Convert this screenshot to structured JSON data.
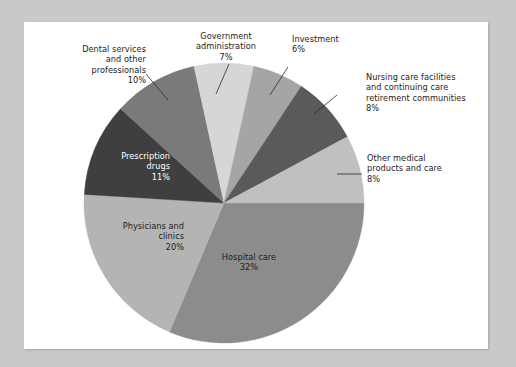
{
  "figure": {
    "background_color": "#c9c9c9",
    "card_color": "#ffffff"
  },
  "chart_data": {
    "type": "pie",
    "title": "",
    "subtitle": "",
    "xlabel": "",
    "ylabel": "",
    "legend_position": "none",
    "grid": false,
    "start_angle_deg": 0,
    "direction": "clockwise",
    "unit": "%",
    "categories": [
      "Hospital care",
      "Physicians and clinics",
      "Prescription drugs",
      "Dental services and other professionals",
      "Government administration",
      "Investment",
      "Nursing care facilities and continuing care retirement communities",
      "Other medical products and care"
    ],
    "values": [
      32,
      20,
      11,
      10,
      7,
      6,
      8,
      8
    ],
    "colors": [
      "#8c8c8c",
      "#b4b4b4",
      "#3f3f3f",
      "#7a7a7a",
      "#d6d6d6",
      "#a5a5a5",
      "#5a5a5a",
      "#c0c0c0"
    ],
    "slices": [
      {
        "label": "Hospital care",
        "value": 32,
        "value_text": "32%",
        "color": "#8c8c8c",
        "label_placement": "inside",
        "text_color": "#1c1c1c"
      },
      {
        "label": "Physicians and clinics",
        "value": 20,
        "value_text": "20%",
        "color": "#b4b4b4",
        "label_placement": "inside",
        "text_color": "#1c1c1c"
      },
      {
        "label": "Prescription drugs",
        "value": 11,
        "value_text": "11%",
        "color": "#3f3f3f",
        "label_placement": "inside",
        "text_color": "#ffffff"
      },
      {
        "label": "Dental services and other professionals",
        "value": 10,
        "value_text": "10%",
        "color": "#7a7a7a",
        "label_placement": "outside",
        "text_color": "#1c1c1c"
      },
      {
        "label": "Government administration",
        "value": 7,
        "value_text": "7%",
        "color": "#d6d6d6",
        "label_placement": "outside",
        "text_color": "#1c1c1c"
      },
      {
        "label": "Investment",
        "value": 6,
        "value_text": "6%",
        "color": "#a5a5a5",
        "label_placement": "outside",
        "text_color": "#1c1c1c"
      },
      {
        "label": "Nursing care facilities and continuing care retirement communities",
        "value": 8,
        "value_text": "8%",
        "color": "#5a5a5a",
        "label_placement": "outside",
        "text_color": "#1c1c1c"
      },
      {
        "label": "Other medical products and care",
        "value": 8,
        "value_text": "8%",
        "color": "#c0c0c0",
        "label_placement": "outside",
        "text_color": "#1c1c1c"
      }
    ]
  },
  "labels": {
    "dental": "Dental services\nand other\nprofessionals\n10%",
    "government": "Government\nadministration\n7%",
    "investment": "Investment\n6%",
    "nursing": "Nursing care facilities\nand continuing care\nretirement communities\n8%",
    "other_medical": "Other medical\nproducts and care\n8%",
    "prescription": "Prescription\ndrugs\n11%",
    "physicians": "Physicians and\nclinics\n20%",
    "hospital": "Hospital care\n32%"
  }
}
